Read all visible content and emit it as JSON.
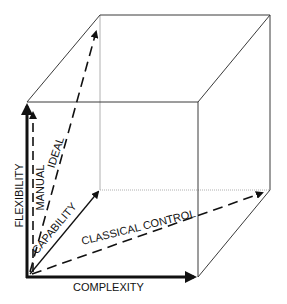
{
  "diagram": {
    "type": "3d-cube",
    "colors": {
      "edge": "#3a3a3a",
      "hidden_edge": "#b0b0b0",
      "arrow": "#111111",
      "text": "#111111",
      "background": "#ffffff"
    },
    "axes": {
      "x_label": "COMPLEXITY",
      "y_label": "FLEXIBILITY"
    },
    "vectors": [
      {
        "id": "ideal",
        "label": "IDEAL",
        "style": "dashed"
      },
      {
        "id": "manual",
        "label": "MANUAL",
        "style": "dashed"
      },
      {
        "id": "capability",
        "label": "CAPABILITY",
        "style": "solid"
      },
      {
        "id": "classical-control",
        "label": "CLASSICAL CONTROL",
        "style": "dashed"
      }
    ]
  }
}
